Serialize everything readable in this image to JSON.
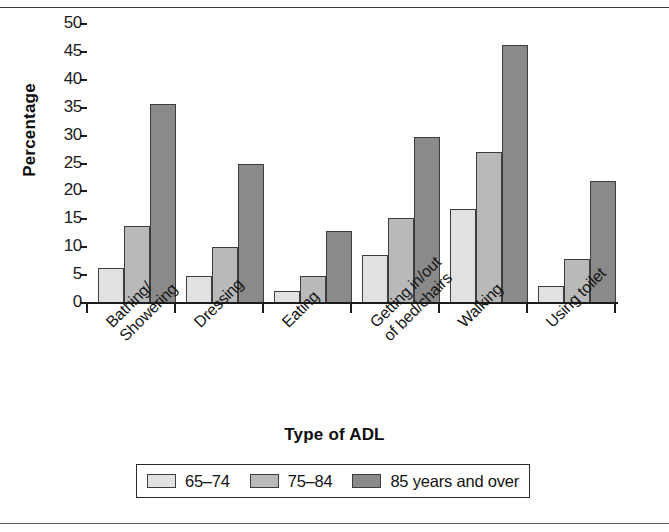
{
  "chart_data": {
    "type": "bar",
    "title": "",
    "xlabel": "Type of ADL",
    "ylabel": "Percentage",
    "ylim": [
      0,
      50
    ],
    "ytick_step": 5,
    "ytick_labels": [
      "0",
      "5",
      "10",
      "15",
      "20",
      "25",
      "30",
      "35",
      "40",
      "45",
      "50"
    ],
    "grid": false,
    "legend_position": "bottom",
    "categories": [
      "Bathing/\nShowering",
      "Dressing",
      "Eating",
      "Getting in/out\nof bed/chairs",
      "Walking",
      "Using toilet"
    ],
    "series": [
      {
        "name": "65–74",
        "values": [
          6.3,
          4.9,
          2.1,
          8.6,
          16.8,
          3.1
        ],
        "color": "#e2e2e2"
      },
      {
        "name": "75–84",
        "values": [
          13.8,
          10.1,
          4.9,
          15.3,
          27.1,
          7.9
        ],
        "color": "#b9b9b9"
      },
      {
        "name": "85 years and over",
        "values": [
          35.6,
          24.9,
          12.9,
          29.8,
          46.3,
          21.9
        ],
        "color": "#8a8a8a"
      }
    ]
  },
  "axes": {
    "y_title": "Percentage",
    "x_title": "Type of ADL"
  },
  "legend": {
    "items": [
      {
        "label": "65–74"
      },
      {
        "label": "75–84"
      },
      {
        "label": "85 years and over"
      }
    ]
  }
}
